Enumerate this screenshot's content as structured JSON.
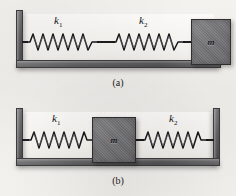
{
  "figure": {
    "background_color": "#f2f0ec",
    "ink_color": "#1d1d1f",
    "surface_color": "#6f6f70",
    "mass_color": "#77777a"
  },
  "panels": [
    {
      "id": "a",
      "caption": "(a)",
      "description": "Two springs in series attached to a wall on the left with a mass at the right end",
      "wall_sides": [
        "left"
      ],
      "springs": [
        {
          "id": "k1",
          "label": "k",
          "subscript": "1",
          "label_text": "k1"
        },
        {
          "id": "k2",
          "label": "k",
          "subscript": "2",
          "label_text": "k2"
        }
      ],
      "mass": {
        "label": "m",
        "position": "right"
      }
    },
    {
      "id": "b",
      "caption": "(b)",
      "description": "Two springs in parallel with a mass between them attached to walls on both sides",
      "wall_sides": [
        "left",
        "right"
      ],
      "springs": [
        {
          "id": "k1",
          "label": "k",
          "subscript": "1",
          "label_text": "k1"
        },
        {
          "id": "k2",
          "label": "k",
          "subscript": "2",
          "label_text": "k2"
        }
      ],
      "mass": {
        "label": "m",
        "position": "center"
      }
    }
  ]
}
